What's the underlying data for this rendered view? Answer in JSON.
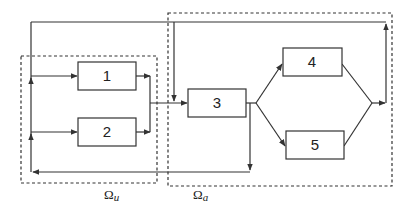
{
  "diagram": {
    "type": "block-flow",
    "colors": {
      "line": "#333333",
      "dashed": "#333333",
      "background": "#ffffff"
    },
    "blocks": [
      {
        "id": "1",
        "label": "1"
      },
      {
        "id": "2",
        "label": "2"
      },
      {
        "id": "3",
        "label": "3"
      },
      {
        "id": "4",
        "label": "4"
      },
      {
        "id": "5",
        "label": "5"
      }
    ],
    "regions": [
      {
        "id": "omega_u",
        "label_base": "Ω",
        "label_sub": "u",
        "contains": [
          "1",
          "2"
        ]
      },
      {
        "id": "omega_a",
        "label_base": "Ω",
        "label_sub": "a",
        "contains": [
          "3",
          "4",
          "5"
        ]
      }
    ],
    "edges": [
      {
        "from": "1",
        "to": "merge"
      },
      {
        "from": "2",
        "to": "merge"
      },
      {
        "from": "merge",
        "to": "3"
      },
      {
        "from": "3",
        "to": "4"
      },
      {
        "from": "3",
        "to": "5"
      },
      {
        "from": "4",
        "to": "join"
      },
      {
        "from": "5",
        "to": "join"
      },
      {
        "from": "join",
        "to": "top-feedback"
      },
      {
        "from": "top-feedback",
        "to": "1"
      },
      {
        "from": "top-feedback",
        "to": "3"
      },
      {
        "from": "3",
        "to": "bottom-feedback"
      },
      {
        "from": "bottom-feedback",
        "to": "2"
      }
    ]
  }
}
